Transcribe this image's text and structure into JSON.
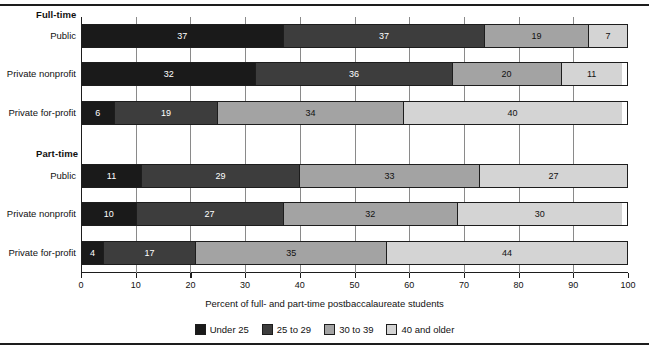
{
  "figure": {
    "axis_title": "Percent of full- and part-time postbaccalaureate students"
  },
  "groups": [
    {
      "heading": "Full-time"
    },
    {
      "heading": "Part-time"
    }
  ],
  "legend": {
    "items": [
      {
        "label": "Under 25",
        "color": "#1a1a1a"
      },
      {
        "label": "25 to 29",
        "color": "#3d3d3d"
      },
      {
        "label": "30 to 39",
        "color": "#a3a3a3"
      },
      {
        "label": "40 and older",
        "color": "#d4d4d4"
      }
    ]
  },
  "chart_data": {
    "type": "bar",
    "orientation": "horizontal",
    "stacked": true,
    "stacked_mode": "percent",
    "title": "",
    "subtitle": "",
    "xlabel": "Percent of full- and part-time postbaccalaureate students",
    "ylabel": "",
    "xlim": [
      0,
      100
    ],
    "xticks": [
      0,
      10,
      20,
      30,
      40,
      50,
      60,
      70,
      80,
      90,
      100
    ],
    "xtick_labels": [
      "0",
      "10",
      "20",
      "30",
      "40",
      "50",
      "60",
      "70",
      "80",
      "90",
      "100"
    ],
    "grid": false,
    "legend_position": "bottom",
    "series": [
      {
        "name": "Under 25",
        "color": "#1a1a1a",
        "values": [
          37,
          32,
          6,
          11,
          10,
          4
        ]
      },
      {
        "name": "25 to 29",
        "color": "#3d3d3d",
        "values": [
          37,
          36,
          19,
          29,
          27,
          17
        ]
      },
      {
        "name": "30 to 39",
        "color": "#a3a3a3",
        "values": [
          19,
          20,
          34,
          33,
          32,
          35
        ]
      },
      {
        "name": "40 and older",
        "color": "#d4d4d4",
        "values": [
          7,
          11,
          40,
          27,
          30,
          44
        ]
      }
    ],
    "categories": [
      "Full-time Public",
      "Full-time Private nonprofit",
      "Full-time Private for-profit",
      "Part-time Public",
      "Part-time Private nonprofit",
      "Part-time Private for-profit"
    ],
    "rows": [
      {
        "group": "Full-time",
        "label": "Public",
        "segments": [
          {
            "category": "Under 25",
            "value": 37,
            "label": "37",
            "color": "#1a1a1a",
            "text_color": "#ffffff"
          },
          {
            "category": "25 to 29",
            "value": 37,
            "label": "37",
            "color": "#3d3d3d",
            "text_color": "#ffffff"
          },
          {
            "category": "30 to 39",
            "value": 19,
            "label": "19",
            "color": "#a3a3a3",
            "text_color": "#111111"
          },
          {
            "category": "40 and older",
            "value": 7,
            "label": "7",
            "color": "#d4d4d4",
            "text_color": "#111111"
          }
        ]
      },
      {
        "group": "Full-time",
        "label": "Private nonprofit",
        "segments": [
          {
            "category": "Under 25",
            "value": 32,
            "label": "32",
            "color": "#1a1a1a",
            "text_color": "#ffffff"
          },
          {
            "category": "25 to 29",
            "value": 36,
            "label": "36",
            "color": "#3d3d3d",
            "text_color": "#ffffff"
          },
          {
            "category": "30 to 39",
            "value": 20,
            "label": "20",
            "color": "#a3a3a3",
            "text_color": "#111111"
          },
          {
            "category": "40 and older",
            "value": 11,
            "label": "11",
            "color": "#d4d4d4",
            "text_color": "#111111"
          }
        ]
      },
      {
        "group": "Full-time",
        "label": "Private for-profit",
        "segments": [
          {
            "category": "Under 25",
            "value": 6,
            "label": "6",
            "color": "#1a1a1a",
            "text_color": "#ffffff"
          },
          {
            "category": "25 to 29",
            "value": 19,
            "label": "19",
            "color": "#3d3d3d",
            "text_color": "#ffffff"
          },
          {
            "category": "30 to 39",
            "value": 34,
            "label": "34",
            "color": "#a3a3a3",
            "text_color": "#111111"
          },
          {
            "category": "40 and older",
            "value": 40,
            "label": "40",
            "color": "#d4d4d4",
            "text_color": "#111111"
          }
        ]
      },
      {
        "group": "Part-time",
        "label": "Public",
        "segments": [
          {
            "category": "Under 25",
            "value": 11,
            "label": "11",
            "color": "#1a1a1a",
            "text_color": "#ffffff"
          },
          {
            "category": "25 to 29",
            "value": 29,
            "label": "29",
            "color": "#3d3d3d",
            "text_color": "#ffffff"
          },
          {
            "category": "30 to 39",
            "value": 33,
            "label": "33",
            "color": "#a3a3a3",
            "text_color": "#111111"
          },
          {
            "category": "40 and older",
            "value": 27,
            "label": "27",
            "color": "#d4d4d4",
            "text_color": "#111111"
          }
        ]
      },
      {
        "group": "Part-time",
        "label": "Private nonprofit",
        "segments": [
          {
            "category": "Under 25",
            "value": 10,
            "label": "10",
            "color": "#1a1a1a",
            "text_color": "#ffffff"
          },
          {
            "category": "25 to 29",
            "value": 27,
            "label": "27",
            "color": "#3d3d3d",
            "text_color": "#ffffff"
          },
          {
            "category": "30 to 39",
            "value": 32,
            "label": "32",
            "color": "#a3a3a3",
            "text_color": "#111111"
          },
          {
            "category": "40 and older",
            "value": 30,
            "label": "30",
            "color": "#d4d4d4",
            "text_color": "#111111"
          }
        ]
      },
      {
        "group": "Part-time",
        "label": "Private for-profit",
        "segments": [
          {
            "category": "Under 25",
            "value": 4,
            "label": "4",
            "color": "#1a1a1a",
            "text_color": "#ffffff"
          },
          {
            "category": "25 to 29",
            "value": 17,
            "label": "17",
            "color": "#3d3d3d",
            "text_color": "#ffffff"
          },
          {
            "category": "30 to 39",
            "value": 35,
            "label": "35",
            "color": "#a3a3a3",
            "text_color": "#111111"
          },
          {
            "category": "40 and older",
            "value": 44,
            "label": "44",
            "color": "#d4d4d4",
            "text_color": "#111111"
          }
        ]
      }
    ]
  }
}
